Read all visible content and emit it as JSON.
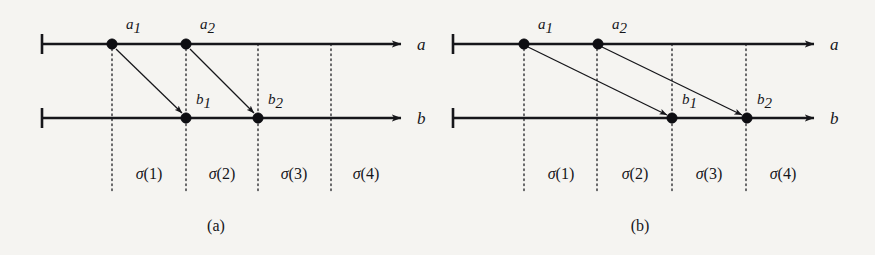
{
  "figure": {
    "background_color": "#f5f4f1",
    "ink_color": "#16161a",
    "width": 875,
    "height": 255,
    "panels": [
      {
        "id": "a",
        "caption": "(a)",
        "axes": [
          {
            "id": "a",
            "label": "a"
          },
          {
            "id": "b",
            "label": "b"
          }
        ],
        "points": [
          {
            "id": "a1",
            "label": "a",
            "subscript": "1",
            "axis": "a",
            "x": 112
          },
          {
            "id": "a2",
            "label": "a",
            "subscript": "2",
            "axis": "a",
            "x": 186
          },
          {
            "id": "b1",
            "label": "b",
            "subscript": "1",
            "axis": "b",
            "x": 186
          },
          {
            "id": "b2",
            "label": "b",
            "subscript": "2",
            "axis": "b",
            "x": 258
          }
        ],
        "arrows": [
          {
            "from": "a1",
            "to": "b1"
          },
          {
            "from": "a2",
            "to": "b2"
          }
        ],
        "intervals": [
          {
            "label": "σ(1)",
            "sigma": "σ",
            "index": "(1)"
          },
          {
            "label": "σ(2)",
            "sigma": "σ",
            "index": "(2)"
          },
          {
            "label": "σ(3)",
            "sigma": "σ",
            "index": "(3)"
          },
          {
            "label": "σ(4)",
            "sigma": "σ",
            "index": "(4)"
          }
        ],
        "guide_x": [
          112,
          186,
          258,
          331
        ]
      },
      {
        "id": "b",
        "caption": "(b)",
        "axes": [
          {
            "id": "a",
            "label": "a"
          },
          {
            "id": "b",
            "label": "b"
          }
        ],
        "points": [
          {
            "id": "a1",
            "label": "a",
            "subscript": "1",
            "axis": "a",
            "x": 524
          },
          {
            "id": "a2",
            "label": "a",
            "subscript": "2",
            "axis": "a",
            "x": 598
          },
          {
            "id": "b1",
            "label": "b",
            "subscript": "1",
            "axis": "b",
            "x": 672
          },
          {
            "id": "b2",
            "label": "b",
            "subscript": "2",
            "axis": "b",
            "x": 747
          }
        ],
        "arrows": [
          {
            "from": "a1",
            "to": "b1"
          },
          {
            "from": "a2",
            "to": "b2"
          }
        ],
        "intervals": [
          {
            "label": "σ(1)",
            "sigma": "σ",
            "index": "(1)"
          },
          {
            "label": "σ(2)",
            "sigma": "σ",
            "index": "(2)"
          },
          {
            "label": "σ(3)",
            "sigma": "σ",
            "index": "(3)"
          },
          {
            "label": "σ(4)",
            "sigma": "σ",
            "index": "(4)"
          }
        ],
        "guide_x": [
          524,
          597,
          672,
          746
        ]
      }
    ]
  },
  "labels": {
    "panel_a": {
      "axis_a": "a",
      "axis_b": "b",
      "a1_base": "a",
      "a1_sub": "1",
      "a2_base": "a",
      "a2_sub": "2",
      "b1_base": "b",
      "b1_sub": "1",
      "b2_base": "b",
      "b2_sub": "2",
      "sigma1": "σ",
      "sigma1_idx": "(1)",
      "sigma2": "σ",
      "sigma2_idx": "(2)",
      "sigma3": "σ",
      "sigma3_idx": "(3)",
      "sigma4": "σ",
      "sigma4_idx": "(4)",
      "caption": "(a)"
    },
    "panel_b": {
      "axis_a": "a",
      "axis_b": "b",
      "a1_base": "a",
      "a1_sub": "1",
      "a2_base": "a",
      "a2_sub": "2",
      "b1_base": "b",
      "b1_sub": "1",
      "b2_base": "b",
      "b2_sub": "2",
      "sigma1": "σ",
      "sigma1_idx": "(1)",
      "sigma2": "σ",
      "sigma2_idx": "(2)",
      "sigma3": "σ",
      "sigma3_idx": "(3)",
      "sigma4": "σ",
      "sigma4_idx": "(4)",
      "caption": "(b)"
    }
  }
}
